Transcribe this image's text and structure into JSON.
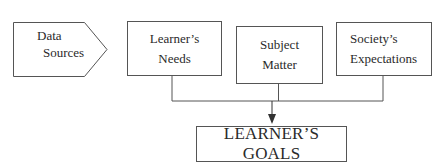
{
  "diagram": {
    "source": {
      "line1": "Data",
      "line2": "Sources"
    },
    "inputs": [
      {
        "line1": "Learner’s",
        "line2": "Needs"
      },
      {
        "line1": "Subject",
        "line2": "Matter"
      },
      {
        "line1": "Society’s",
        "line2": "Expectations"
      }
    ],
    "output": {
      "label": "LEARNER’S GOALS"
    },
    "colors": {
      "stroke": "#555555",
      "text": "#2a2a2a"
    }
  }
}
